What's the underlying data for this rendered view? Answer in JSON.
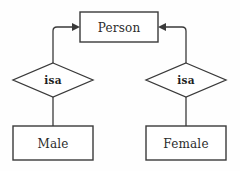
{
  "diagram": {
    "type": "er-isa-hierarchy",
    "canvas": {
      "width": 240,
      "height": 171,
      "background": "#fefefe"
    },
    "stroke_color": "#3a3a3a",
    "text_color": "#2b2b2b",
    "entities": [
      {
        "id": "person",
        "label": "Person",
        "role": "supertype",
        "shape": "rectangle",
        "x": 80,
        "y": 12,
        "width": 78,
        "height": 30,
        "cx": 119,
        "cy": 27
      },
      {
        "id": "male",
        "label": "Male",
        "role": "subtype",
        "shape": "rectangle",
        "x": 13,
        "y": 126,
        "width": 80,
        "height": 34,
        "cx": 53,
        "cy": 143
      },
      {
        "id": "female",
        "label": "Female",
        "role": "subtype",
        "shape": "rectangle",
        "x": 146,
        "y": 126,
        "width": 80,
        "height": 34,
        "cx": 186,
        "cy": 143
      }
    ],
    "relationships": [
      {
        "id": "isa-left",
        "label": "isa",
        "shape": "diamond",
        "cx": 53,
        "cy": 80,
        "half_width": 40,
        "half_height": 17,
        "from": "male",
        "to": "person"
      },
      {
        "id": "isa-right",
        "label": "isa",
        "shape": "diamond",
        "cx": 186,
        "cy": 80,
        "half_width": 40,
        "half_height": 17,
        "from": "female",
        "to": "person"
      }
    ],
    "connectors": [
      {
        "id": "left-isa-to-person",
        "kind": "arrow",
        "direction": "to-supertype",
        "path": "M 53 63 L 53 31 Q 53 27 57 27 L 74 27",
        "arrow_at": {
          "x": 80,
          "y": 27,
          "points": "80,27 72,23 72,31"
        }
      },
      {
        "id": "right-isa-to-person",
        "kind": "arrow",
        "direction": "to-supertype",
        "path": "M 186 63 L 186 31 Q 186 27 182 27 L 164 27",
        "arrow_at": {
          "x": 158,
          "y": 27,
          "points": "158,27 166,23 166,31"
        }
      },
      {
        "id": "left-isa-to-male",
        "kind": "line",
        "path": "M 53 97 L 53 126"
      },
      {
        "id": "right-isa-to-female",
        "kind": "line",
        "path": "M 186 97 L 186 126"
      }
    ]
  }
}
